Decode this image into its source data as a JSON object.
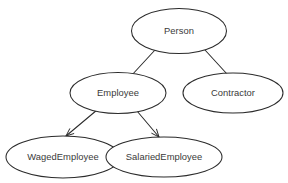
{
  "diagram": {
    "type": "class-inheritance-tree",
    "background_color": "#ffffff",
    "stroke_color": "#2b2b2b",
    "text_color": "#3a3a3a",
    "node_shape": "ellipse",
    "nodes": [
      {
        "id": "person",
        "label": "Person",
        "cx": 179,
        "cy": 31,
        "rx": 47.5,
        "ry": 22.5,
        "level": 0
      },
      {
        "id": "employee",
        "label": "Employee",
        "cx": 118,
        "cy": 93,
        "rx": 48,
        "ry": 20.5,
        "level": 1
      },
      {
        "id": "contractor",
        "label": "Contractor",
        "cx": 233,
        "cy": 93,
        "rx": 50,
        "ry": 20,
        "level": 1
      },
      {
        "id": "waged_employee",
        "label": "WagedEmployee",
        "cx": 63,
        "cy": 157,
        "rx": 57,
        "ry": 21,
        "level": 2
      },
      {
        "id": "salaried_employee",
        "label": "SalariedEmployee",
        "cx": 164,
        "cy": 157,
        "rx": 58,
        "ry": 20,
        "level": 2
      }
    ],
    "edges": [
      {
        "id": "person-employee",
        "from": "person",
        "to": "employee",
        "x1": 155,
        "y1": 50,
        "x2": 131,
        "y2": 76,
        "arrowhead": false
      },
      {
        "id": "person-contractor",
        "from": "person",
        "to": "contractor",
        "x1": 205,
        "y1": 50,
        "x2": 227,
        "y2": 74,
        "arrowhead": false
      },
      {
        "id": "employee-waged",
        "from": "employee",
        "to": "waged_employee",
        "x1": 97,
        "y1": 110,
        "x2": 66,
        "y2": 136,
        "arrowhead": true
      },
      {
        "id": "employee-salaried",
        "from": "employee",
        "to": "salaried_employee",
        "x1": 137,
        "y1": 111,
        "x2": 159,
        "y2": 137,
        "arrowhead": true
      }
    ]
  }
}
